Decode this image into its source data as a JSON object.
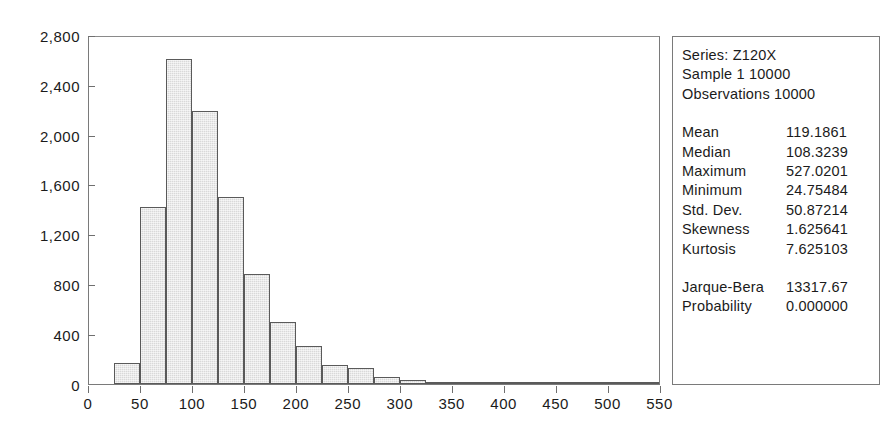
{
  "title": "",
  "chart_data": {
    "type": "bar",
    "title": "",
    "xlabel": "",
    "ylabel": "",
    "xlim": [
      0,
      550
    ],
    "ylim": [
      0,
      2800
    ],
    "grid": false,
    "legend": "none",
    "bin_width": 25,
    "ytick_labels": [
      "0",
      "400",
      "800",
      "1,200",
      "1,600",
      "2,000",
      "2,400",
      "2,800"
    ],
    "ytick_values": [
      0,
      400,
      800,
      1200,
      1600,
      2000,
      2400,
      2800
    ],
    "xtick_labels": [
      "0",
      "50",
      "100",
      "150",
      "200",
      "250",
      "300",
      "350",
      "400",
      "450",
      "500",
      "550"
    ],
    "xtick_values": [
      0,
      50,
      100,
      150,
      200,
      250,
      300,
      350,
      400,
      450,
      500,
      550
    ],
    "bin_starts": [
      25,
      50,
      75,
      100,
      125,
      150,
      175,
      200,
      225,
      250,
      275,
      300,
      325,
      350,
      375,
      400,
      425,
      450,
      475,
      500,
      525
    ],
    "values": [
      165,
      1420,
      2615,
      2190,
      1500,
      880,
      500,
      305,
      155,
      125,
      55,
      30,
      18,
      18,
      8,
      8,
      4,
      4,
      2,
      2,
      1
    ],
    "categories": [
      "25-50",
      "50-75",
      "75-100",
      "100-125",
      "125-150",
      "150-175",
      "175-200",
      "200-225",
      "225-250",
      "250-275",
      "275-300",
      "300-325",
      "325-350",
      "350-375",
      "375-400",
      "400-425",
      "425-450",
      "450-475",
      "475-500",
      "500-525",
      "525-550"
    ]
  },
  "stats": {
    "series_label": "Series: Z120X",
    "sample_label": "Sample 1 10000",
    "observations_label": "Observations 10000",
    "rows": [
      {
        "key": "Mean",
        "value": "119.1861"
      },
      {
        "key": "Median",
        "value": "108.3239"
      },
      {
        "key": "Maximum",
        "value": "527.0201"
      },
      {
        "key": "Minimum",
        "value": "24.75484"
      },
      {
        "key": "Std. Dev.",
        "value": "50.87214"
      },
      {
        "key": "Skewness",
        "value": "1.625641"
      },
      {
        "key": "Kurtosis",
        "value": "7.625103"
      }
    ],
    "test_rows": [
      {
        "key": "Jarque-Bera",
        "value": "13317.67"
      },
      {
        "key": "Probability",
        "value": "0.000000"
      }
    ]
  },
  "colors": {
    "bar_fill": "#d9d9d9",
    "bar_border": "#5a5a5a",
    "axis": "#7a7a7a",
    "text": "#1b1b1b"
  }
}
